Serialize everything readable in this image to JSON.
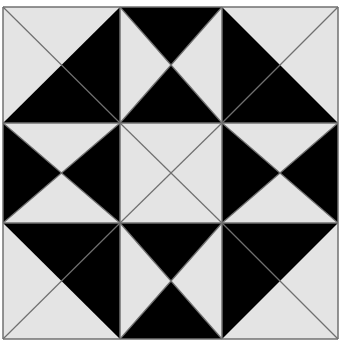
{
  "pattern": {
    "name": "quilt-block-pattern",
    "grid": "3x3",
    "colors": {
      "background": "#ffffff",
      "light": "#e4e4e4",
      "dark": "#000000",
      "line": "#707070"
    },
    "frame": {
      "x": [
        3,
        120,
        222,
        338
      ],
      "y": [
        7,
        123,
        223,
        339
      ]
    },
    "blocks": [
      {
        "row": 0,
        "col": 0,
        "type": "corner-half-square",
        "dark_side": "bottom-right",
        "diagonal": "tl-br"
      },
      {
        "row": 0,
        "col": 1,
        "type": "hourglass",
        "dark": [
          "top",
          "bottom"
        ],
        "light": [
          "left",
          "right"
        ]
      },
      {
        "row": 0,
        "col": 2,
        "type": "corner-half-square",
        "dark_side": "bottom-left",
        "diagonal": "tr-bl"
      },
      {
        "row": 1,
        "col": 0,
        "type": "hourglass",
        "dark": [
          "left",
          "right"
        ],
        "light": [
          "top",
          "bottom"
        ]
      },
      {
        "row": 1,
        "col": 1,
        "type": "center-x",
        "dark": [],
        "light": [
          "top",
          "bottom",
          "left",
          "right"
        ]
      },
      {
        "row": 1,
        "col": 2,
        "type": "hourglass",
        "dark": [
          "left",
          "right"
        ],
        "light": [
          "top",
          "bottom"
        ]
      },
      {
        "row": 2,
        "col": 0,
        "type": "corner-half-square",
        "dark_side": "top-right",
        "diagonal": "bl-tr"
      },
      {
        "row": 2,
        "col": 1,
        "type": "hourglass",
        "dark": [
          "top",
          "bottom"
        ],
        "light": [
          "left",
          "right"
        ]
      },
      {
        "row": 2,
        "col": 2,
        "type": "corner-half-square",
        "dark_side": "top-left",
        "diagonal": "br-tl"
      }
    ]
  }
}
